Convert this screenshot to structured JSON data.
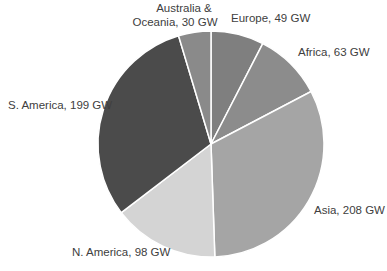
{
  "chart_data": {
    "type": "pie",
    "title": "",
    "unit": "GW",
    "start_angle_deg": 0,
    "direction": "clockwise",
    "slices": [
      {
        "label": "Europe",
        "value": 49,
        "color": "#7f7f7f",
        "display": "Europe, 49 GW"
      },
      {
        "label": "Africa",
        "value": 63,
        "color": "#8c8c8c",
        "display": "Africa, 63 GW"
      },
      {
        "label": "Asia",
        "value": 208,
        "color": "#a5a5a5",
        "display": "Asia, 208 GW"
      },
      {
        "label": "N. America",
        "value": 98,
        "color": "#d4d4d4",
        "display": "N. America, 98 GW"
      },
      {
        "label": "S. America",
        "value": 199,
        "color": "#4b4b4b",
        "display": "S. America, 199 GW"
      },
      {
        "label": "Australia & Oceania",
        "value": 30,
        "color": "#8a8a8a",
        "display_line1": "Australia &",
        "display_line2": "Oceania, 30 GW"
      }
    ],
    "legend": "none (data labels outside slices)"
  }
}
